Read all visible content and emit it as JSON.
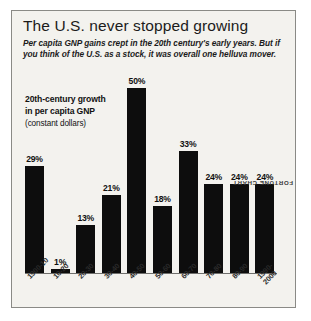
{
  "chart_data": {
    "type": "bar",
    "title": "The U.S. never stopped growing",
    "subtitle": "Per capita GNP gains crept in the 20th century's early years. But if you think of the U.S. as a stock, it was overall one helluva mover.",
    "legend_line1": "20th-century growth",
    "legend_line2": "in per capita GNP",
    "legend_line3": "(constant dollars)",
    "credit": "FORTUNE CHART",
    "xlabel": "",
    "ylabel": "",
    "ylim": [
      0,
      50
    ],
    "grid": false,
    "legend_position": "upper-left",
    "bar_color": "#0d0d0d",
    "categories": [
      "1900-10",
      "10-20",
      "20-30",
      "30-40",
      "40-50",
      "50-60",
      "60-70",
      "70-80",
      "80-90",
      "1990-2000"
    ],
    "values": [
      29,
      1,
      13,
      21,
      50,
      18,
      33,
      24,
      24,
      24
    ],
    "value_labels": [
      "29%",
      "1%",
      "13%",
      "21%",
      "50%",
      "18%",
      "33%",
      "24%",
      "24%",
      "24%"
    ]
  }
}
